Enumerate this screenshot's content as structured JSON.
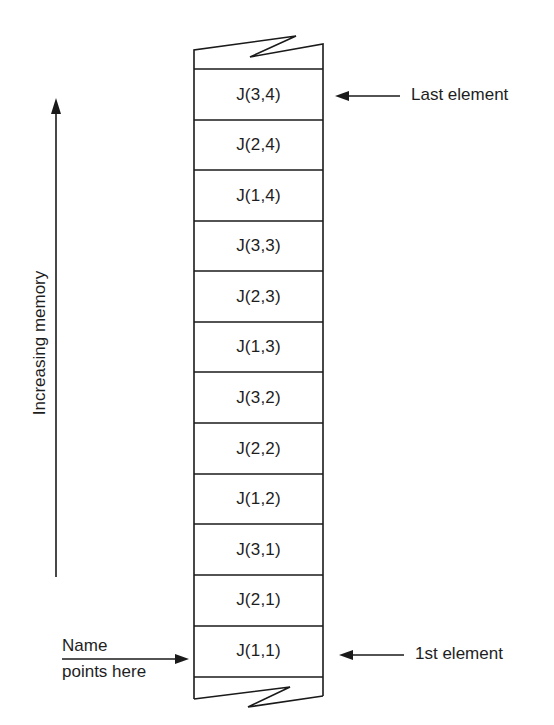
{
  "diagram": {
    "axis_label": "Increasing memory",
    "cells": [
      {
        "label": "J(3,4)"
      },
      {
        "label": "J(2,4)"
      },
      {
        "label": "J(1,4)"
      },
      {
        "label": "J(3,3)"
      },
      {
        "label": "J(2,3)"
      },
      {
        "label": "J(1,3)"
      },
      {
        "label": "J(3,2)"
      },
      {
        "label": "J(2,2)"
      },
      {
        "label": "J(1,2)"
      },
      {
        "label": "J(3,1)"
      },
      {
        "label": "J(2,1)"
      },
      {
        "label": "J(1,1)"
      }
    ],
    "annotations": {
      "last_element": "Last element",
      "first_element": "1st element",
      "name_line1": "Name",
      "name_line2": "points here"
    },
    "colors": {
      "line": "#1a1a1a",
      "background": "#ffffff"
    }
  }
}
